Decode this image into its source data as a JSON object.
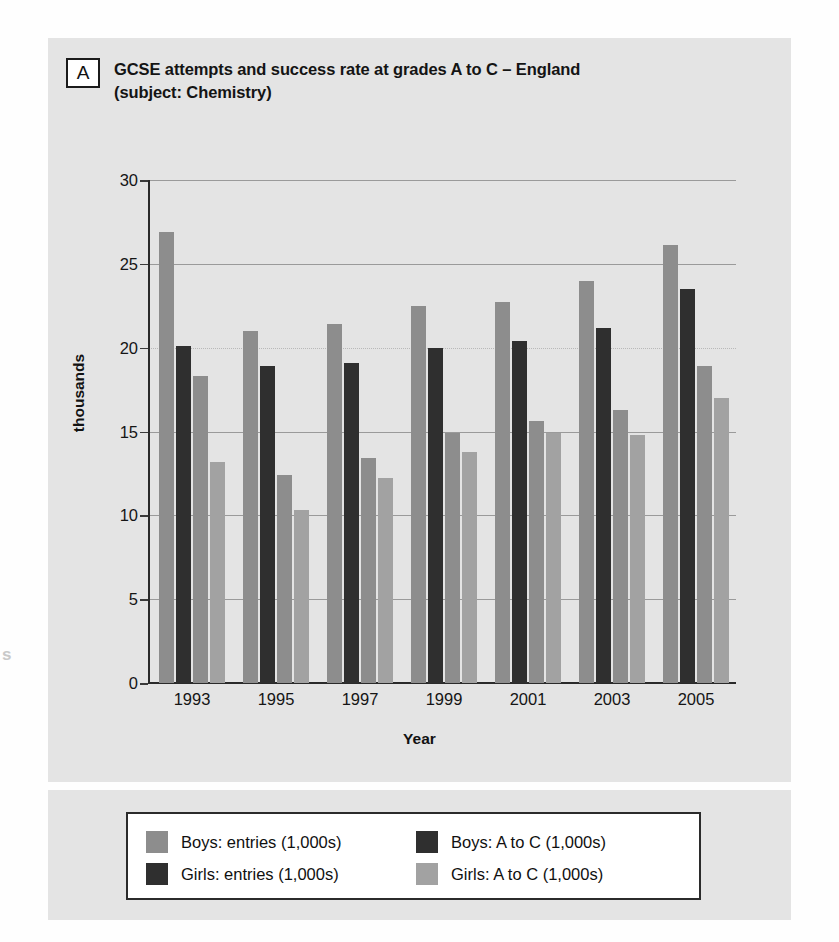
{
  "panel": {
    "letter": "A",
    "title_line1": "GCSE attempts and success rate at grades A to C – England",
    "title_line2": "(subject: Chemistry)"
  },
  "chart_data": {
    "type": "bar",
    "title": "GCSE attempts and success rate at grades A to C – England (subject: Chemistry)",
    "xlabel": "Year",
    "ylabel": "thousands",
    "categories": [
      "1993",
      "1995",
      "1997",
      "1999",
      "2001",
      "2003",
      "2005"
    ],
    "yticks": [
      0,
      5,
      10,
      15,
      20,
      25,
      30
    ],
    "ylim": [
      0,
      30
    ],
    "grid": true,
    "legend_position": "below",
    "series": [
      {
        "name": "Boys: entries (1,000s)",
        "color": "#8d8d8d",
        "values": [
          26.9,
          21.0,
          21.4,
          22.5,
          22.7,
          24.0,
          26.1
        ]
      },
      {
        "name": "Girls: entries (1,000s)",
        "color": "#2f2f2f",
        "values": [
          20.1,
          18.9,
          19.1,
          20.0,
          20.4,
          21.2,
          23.5
        ]
      },
      {
        "name": "Boys: A to C (1,000s)",
        "color": "#2f2f2f",
        "values": [
          18.3,
          12.4,
          13.4,
          14.9,
          15.6,
          16.3,
          18.9
        ]
      },
      {
        "name": "Girls: A to C (1,000s)",
        "color": "#a2a2a2",
        "values": [
          13.2,
          10.3,
          12.2,
          13.8,
          14.9,
          14.8,
          17.0
        ]
      }
    ],
    "bar_order": [
      {
        "series": "Boys: entries (1,000s)",
        "color": "#8d8d8d"
      },
      {
        "series": "Girls: entries (1,000s)",
        "color": "#2f2f2f"
      },
      {
        "series": "Boys: A to C (1,000s)",
        "color": "#8d8d8d"
      },
      {
        "series": "Girls: A to C (1,000s)",
        "color": "#a2a2a2"
      }
    ]
  },
  "legend": {
    "items": [
      {
        "label": "Boys: entries (1,000s)",
        "color": "#8d8d8d"
      },
      {
        "label": "Boys: A to C (1,000s)",
        "color": "#2f2f2f"
      },
      {
        "label": "Girls: entries (1,000s)",
        "color": "#2f2f2f"
      },
      {
        "label": "Girls: A to C (1,000s)",
        "color": "#a2a2a2"
      }
    ]
  },
  "artifact": {
    "glyph": "s"
  }
}
